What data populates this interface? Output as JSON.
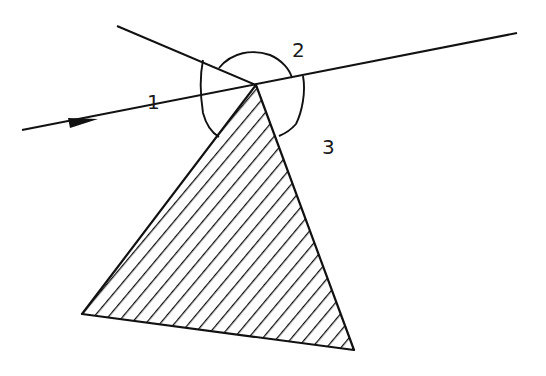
{
  "diagram": {
    "type": "geometry",
    "labels": [
      {
        "id": "angle-1",
        "text": "1"
      },
      {
        "id": "angle-2",
        "text": "2"
      },
      {
        "id": "angle-3",
        "text": "3"
      }
    ],
    "elements": {
      "ray": {
        "from": [
          22,
          130
        ],
        "to": [
          517,
          33
        ],
        "arrow": true
      },
      "second_line": {
        "from": [
          117,
          26
        ],
        "to": [
          256,
          85
        ]
      },
      "triangle": {
        "apex": [
          256,
          85
        ],
        "bottom_left": [
          82,
          314
        ],
        "bottom_right": [
          354,
          350
        ],
        "fill": "hatched"
      }
    },
    "colors": {
      "stroke": "#111111",
      "background": "#ffffff"
    }
  }
}
